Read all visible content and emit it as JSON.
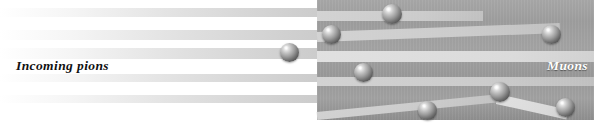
{
  "figure": {
    "type": "physics-beam-diagram",
    "width": 594,
    "height": 129,
    "background_color": "#ffffff"
  },
  "labels": {
    "left": "Incoming pions",
    "right": "Muons"
  },
  "absorber": {
    "name": "absorber-block",
    "x": 317,
    "y": 0,
    "width": 277,
    "height": 120,
    "color": "#9e9e9e"
  },
  "colors": {
    "beam": "#d6d6d6",
    "absorber": "#9e9e9e",
    "sphere_light": "#ffffff",
    "sphere_dark": "#4e4e4e",
    "label_left": "#111111",
    "label_right": "#ffffff"
  },
  "bands": [
    {
      "id": "pion-band-1",
      "x": 0,
      "y": 8,
      "w": 322,
      "h": 9,
      "rot": 0,
      "kind": "pion"
    },
    {
      "id": "pion-band-2",
      "x": 0,
      "y": 30,
      "w": 322,
      "h": 10,
      "rot": 0,
      "kind": "pion"
    },
    {
      "id": "pion-band-3",
      "x": 0,
      "y": 48,
      "w": 322,
      "h": 11,
      "rot": 0,
      "kind": "pion"
    },
    {
      "id": "pion-band-4",
      "x": 0,
      "y": 74,
      "w": 322,
      "h": 8,
      "rot": 0,
      "kind": "pion"
    },
    {
      "id": "pion-band-5",
      "x": 0,
      "y": 95,
      "w": 322,
      "h": 8,
      "rot": 0,
      "kind": "pion"
    },
    {
      "id": "muon-band-1",
      "x": 317,
      "y": 11,
      "w": 166,
      "h": 10,
      "rot": 0,
      "kind": "muon"
    },
    {
      "id": "muon-band-2",
      "x": 317,
      "y": 32,
      "w": 243,
      "h": 10,
      "rot": -2.1,
      "kind": "muon"
    },
    {
      "id": "muon-band-3",
      "x": 317,
      "y": 51,
      "w": 278,
      "h": 11,
      "rot": 0,
      "kind": "muon-bright"
    },
    {
      "id": "muon-band-4",
      "x": 317,
      "y": 77,
      "w": 278,
      "h": 9,
      "rot": 0,
      "kind": "muon"
    },
    {
      "id": "muon-band-5",
      "x": 317,
      "y": 112,
      "w": 190,
      "h": 8,
      "rot": -5.6,
      "kind": "muon"
    },
    {
      "id": "muon-band-6",
      "x": 497,
      "y": 94,
      "w": 72,
      "h": 10,
      "rot": 12.5,
      "kind": "muon-bright"
    }
  ],
  "particles": [
    {
      "id": "particle-1",
      "name": "pion-incoming",
      "cx": 289,
      "cy": 52,
      "d": 19
    },
    {
      "id": "particle-2",
      "name": "muon-upper-left",
      "cx": 331,
      "cy": 34,
      "d": 19
    },
    {
      "id": "particle-3",
      "name": "muon-top",
      "cx": 392,
      "cy": 14,
      "d": 20
    },
    {
      "id": "particle-4",
      "name": "muon-right-upper",
      "cx": 551,
      "cy": 34,
      "d": 19
    },
    {
      "id": "particle-5",
      "name": "muon-middle",
      "cx": 363,
      "cy": 72,
      "d": 19
    },
    {
      "id": "particle-6",
      "name": "muon-lower-left",
      "cx": 427,
      "cy": 110,
      "d": 19
    },
    {
      "id": "particle-7",
      "name": "muon-lower-mid",
      "cx": 500,
      "cy": 92,
      "d": 20
    },
    {
      "id": "particle-8",
      "name": "muon-lower-right",
      "cx": 565,
      "cy": 107,
      "d": 19
    }
  ]
}
